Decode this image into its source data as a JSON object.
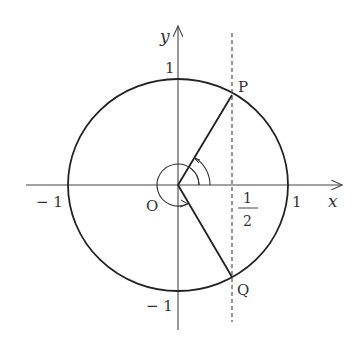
{
  "diagram": {
    "axes": {
      "x_label": "x",
      "y_label": "y",
      "origin_label": "O"
    },
    "ticks": {
      "x_pos": "1",
      "x_neg": "− 1",
      "y_pos": "1",
      "y_neg": "− 1",
      "half_num": "1",
      "half_den": "2"
    },
    "points": {
      "P": {
        "label": "P",
        "x": 0.5,
        "y": 0.866
      },
      "Q": {
        "label": "Q",
        "x": 0.5,
        "y": -0.866
      }
    },
    "dashed_line": {
      "x": 0.5,
      "label": "x = 1/2"
    },
    "angles": {
      "to_P_deg": 60,
      "to_Q_deg": 300
    },
    "colors": {
      "stroke": "#222222",
      "axis": "#444444",
      "text": "#333333",
      "background": "#ffffff"
    }
  }
}
